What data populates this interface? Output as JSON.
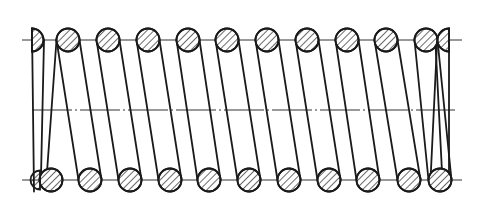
{
  "diagram": {
    "type": "engineering-drawing",
    "colors": {
      "line": "#1a1a1a",
      "hatch": "#1a1a1a",
      "background": "#ffffff",
      "centerline": "#333333"
    },
    "geometry": {
      "wire_radius": 11.5,
      "top_row_y": 40,
      "bottom_row_y": 180,
      "axis_y": 110,
      "pitch": 39.8,
      "top_centers": [
        68,
        108,
        148,
        188,
        227,
        267,
        307,
        347,
        386,
        426
      ],
      "bottom_centers": [
        51,
        90,
        130,
        170,
        209,
        249,
        289,
        329,
        368,
        409,
        440
      ],
      "left_end_half_section_x": 38,
      "right_end_half_section_x": 443,
      "centerlines": {
        "top": {
          "x1": 22,
          "x2": 462,
          "y": 40
        },
        "axis": {
          "x1": 32,
          "x2": 455,
          "y": 110,
          "style": "dash-dot"
        },
        "bottom": {
          "x1": 22,
          "x2": 462,
          "y": 180
        }
      }
    },
    "elements": [
      "top-row-wire-sections",
      "bottom-row-wire-sections",
      "coil-tangent-lines",
      "spring-axis-centerline",
      "ground-end-half-sections"
    ]
  }
}
